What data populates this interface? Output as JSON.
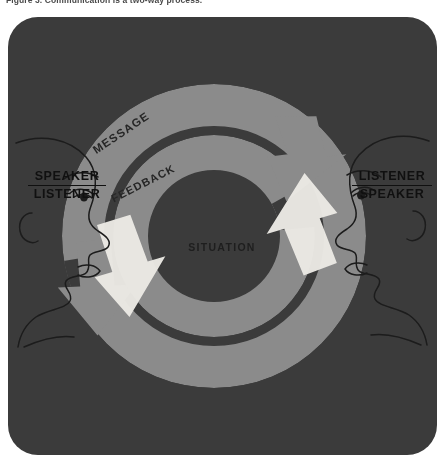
{
  "figure": {
    "caption": "Figure 3.  Communication is a two-way process."
  },
  "diagram": {
    "center_label": "SITUATION",
    "arcs": [
      {
        "id": "message",
        "label": "MESSAGE",
        "direction": "clockwise",
        "ring": "outer"
      },
      {
        "id": "feedback",
        "label": "FEEDBACK",
        "direction": "counter-clockwise",
        "ring": "inner"
      }
    ],
    "roles": {
      "left": {
        "primary": "SPEAKER",
        "secondary": "LISTENER"
      },
      "right": {
        "primary": "LISTENER",
        "secondary": "SPEAKER"
      }
    },
    "colors": {
      "panel_background": "#3c3c3c",
      "arc_band": "#8f8f8f",
      "arrow_light": "#f2f0ea",
      "face_line": "#1c1c1c",
      "label_text": "#101010",
      "page_background": "#ffffff"
    }
  }
}
